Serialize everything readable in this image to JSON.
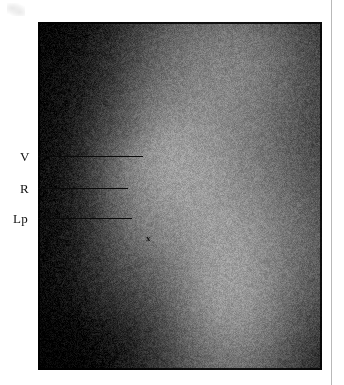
{
  "figure": {
    "kind": "radiograph",
    "modality": "plain-film lateral radiograph",
    "plate": {
      "left": 38,
      "top": 22,
      "width": 284,
      "height": 348,
      "background_hex": "#0c0c0c"
    },
    "page_background_hex": "#ffffff",
    "rule_color_hex": "#b9b9b9",
    "annotation_color_hex": "#0a0a0a"
  },
  "annotations": {
    "labels": [
      {
        "id": "v",
        "text": "V",
        "label_x": 20,
        "label_y": 150,
        "leader_x": 38,
        "leader_y": 156,
        "leader_width": 105
      },
      {
        "id": "r",
        "text": "R",
        "label_x": 20,
        "label_y": 182,
        "leader_x": 38,
        "leader_y": 188,
        "leader_width": 90
      },
      {
        "id": "lp",
        "text": "Lp",
        "label_x": 13,
        "label_y": 212,
        "leader_x": 38,
        "leader_y": 218,
        "leader_width": 94
      }
    ],
    "plate_marks": [
      {
        "id": "x-marker",
        "text": "x",
        "x": 146,
        "y": 234
      }
    ]
  },
  "image_content": {
    "description": "Scanned lateral radiograph showing a bright soft-tissue column against a dark exposed background, with a dense opaque region occupying the left and upper-left of the plate.",
    "grain": {
      "amount": 0.16,
      "seed": 20481
    },
    "field_stops": [
      {
        "name": "dark-surround",
        "gray": 14
      },
      {
        "name": "mid-shadow",
        "gray": 92
      },
      {
        "name": "soft-tissue",
        "gray": 176
      },
      {
        "name": "bright-column",
        "gray": 226
      },
      {
        "name": "highlight",
        "gray": 243
      }
    ],
    "regions": [
      {
        "name": "upper-left-dense-block",
        "cx": 0.06,
        "cy": 0.14,
        "rx": 0.38,
        "ry": 0.3,
        "gray": 10
      },
      {
        "name": "left-dark-band",
        "cx": 0.02,
        "cy": 0.5,
        "rx": 0.3,
        "ry": 0.46,
        "gray": 12
      },
      {
        "name": "lower-left-dense-block",
        "cx": 0.1,
        "cy": 0.92,
        "rx": 0.42,
        "ry": 0.34,
        "gray": 16
      },
      {
        "name": "right-dark-margin",
        "cx": 1.02,
        "cy": 0.3,
        "rx": 0.2,
        "ry": 0.42,
        "gray": 30
      },
      {
        "name": "upper-soft-tissue-sheet",
        "cx": 0.62,
        "cy": 0.12,
        "rx": 0.46,
        "ry": 0.26,
        "gray": 196
      },
      {
        "name": "bright-column-upper",
        "cx": 0.42,
        "cy": 0.4,
        "rx": 0.26,
        "ry": 0.22,
        "gray": 236
      },
      {
        "name": "bright-column-lower",
        "cx": 0.66,
        "cy": 0.8,
        "rx": 0.2,
        "ry": 0.3,
        "gray": 232
      },
      {
        "name": "central-soft-tissue",
        "cx": 0.52,
        "cy": 0.62,
        "rx": 0.34,
        "ry": 0.28,
        "gray": 186
      },
      {
        "name": "dense-nodule",
        "cx": 0.27,
        "cy": 0.29,
        "rx": 0.09,
        "ry": 0.06,
        "gray": 70
      },
      {
        "name": "posterior-shadow-fold",
        "cx": 0.4,
        "cy": 0.6,
        "rx": 0.14,
        "ry": 0.1,
        "gray": 140
      },
      {
        "name": "inferior-shadow-wedge",
        "cx": 0.32,
        "cy": 0.74,
        "rx": 0.22,
        "ry": 0.14,
        "gray": 96
      },
      {
        "name": "right-mid-gradient",
        "cx": 0.88,
        "cy": 0.56,
        "rx": 0.26,
        "ry": 0.34,
        "gray": 150
      },
      {
        "name": "bottom-gradient",
        "cx": 0.58,
        "cy": 1.02,
        "rx": 0.34,
        "ry": 0.18,
        "gray": 120
      }
    ]
  }
}
